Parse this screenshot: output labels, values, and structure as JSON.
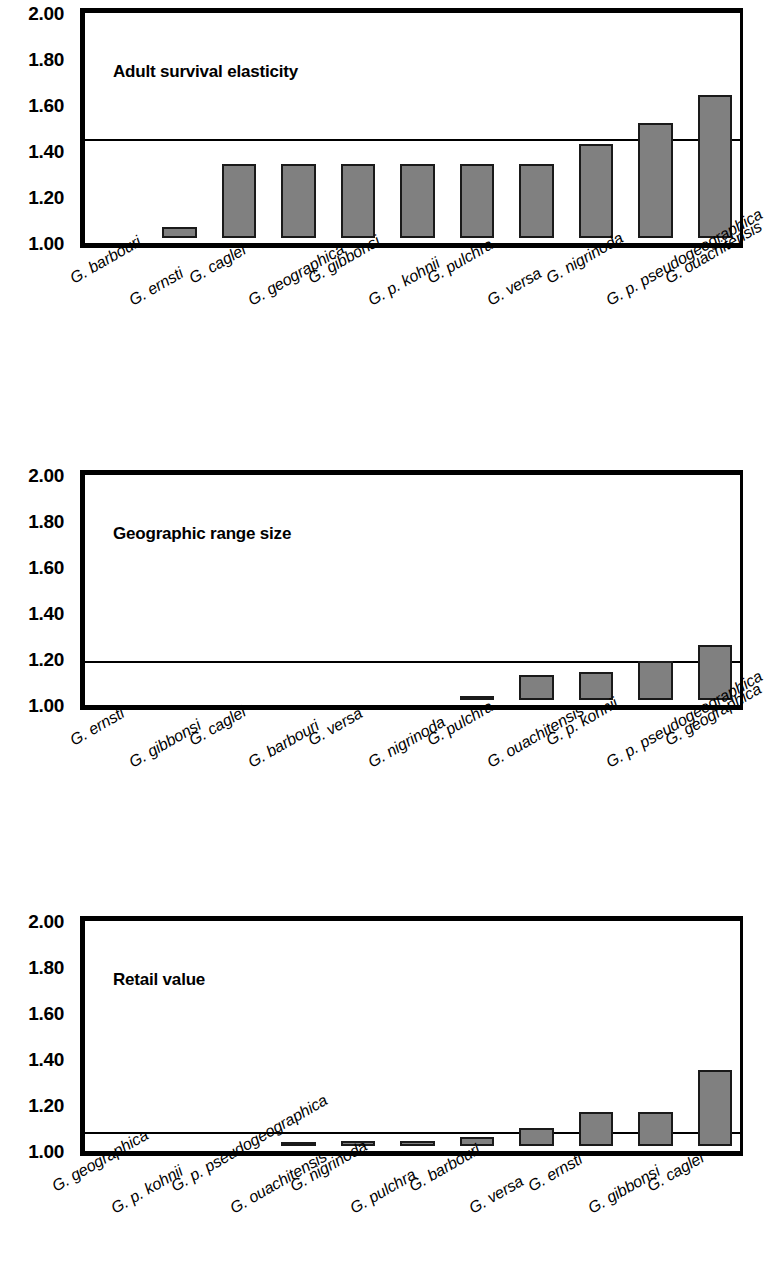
{
  "figure": {
    "background": "#ffffff",
    "bar_fill": "#808080",
    "bar_stroke": "#1a1a1a",
    "axis_color": "#000000"
  },
  "y_ticks": [
    "2.00",
    "1.80",
    "1.60",
    "1.40",
    "1.20",
    "1.00"
  ],
  "panels": [
    {
      "id": "adult-survival-elasticity",
      "title": "Adult survival elasticity",
      "reference_line": 1.47
    },
    {
      "id": "geographic-range-size",
      "title": "Geographic range size",
      "reference_line": 1.21
    },
    {
      "id": "retail-value",
      "title": "Retail value",
      "reference_line": 1.1
    }
  ],
  "chart_data": [
    {
      "type": "bar",
      "title": "Adult survival elasticity",
      "xlabel": "",
      "ylabel": "",
      "ylim": [
        1.0,
        2.0
      ],
      "yticks": [
        1.0,
        1.2,
        1.4,
        1.6,
        1.8,
        2.0
      ],
      "grid": false,
      "legend": "none",
      "reference_line": 1.47,
      "categories": [
        "G. barbouri",
        "G. ernsti",
        "G. caglei",
        "G. geographica",
        "G. gibbonsi",
        "G. p. kohnii",
        "G. pulchra",
        "G. versa",
        "G. nigrinoda",
        "G. p. pseudogeographica",
        "G. ouachitensis"
      ],
      "values": [
        1.0,
        1.05,
        1.32,
        1.32,
        1.32,
        1.32,
        1.32,
        1.32,
        1.41,
        1.5,
        1.62
      ]
    },
    {
      "type": "bar",
      "title": "Geographic range size",
      "xlabel": "",
      "ylabel": "",
      "ylim": [
        1.0,
        2.0
      ],
      "yticks": [
        1.0,
        1.2,
        1.4,
        1.6,
        1.8,
        2.0
      ],
      "grid": false,
      "legend": "none",
      "reference_line": 1.21,
      "categories": [
        "G. ernsti",
        "G. gibbonsi",
        "G. caglei",
        "G. barbouri",
        "G. versa",
        "G. nigrinoda",
        "G. pulchra",
        "G. ouachitensis",
        "G. p. kohnii",
        "G. p. pseudogeographica",
        "G. geographica"
      ],
      "values": [
        1.0,
        1.0,
        1.0,
        1.0,
        1.0,
        1.0,
        1.01,
        1.11,
        1.12,
        1.17,
        1.24
      ]
    },
    {
      "type": "bar",
      "title": "Retail value",
      "xlabel": "",
      "ylabel": "",
      "ylim": [
        1.0,
        2.0
      ],
      "yticks": [
        1.0,
        1.2,
        1.4,
        1.6,
        1.8,
        2.0
      ],
      "grid": false,
      "legend": "none",
      "reference_line": 1.1,
      "categories": [
        "G. geographica",
        "G. p. kohnii",
        "G. p. pseudogeographica",
        "G. ouachitensis",
        "G. nigrinoda",
        "G. pulchra",
        "G. barbouri",
        "G. versa",
        "G. ernsti",
        "G. gibbonsi",
        "G. caglei"
      ],
      "values": [
        1.0,
        1.0,
        1.0,
        1.01,
        1.02,
        1.02,
        1.04,
        1.08,
        1.15,
        1.15,
        1.33
      ]
    }
  ]
}
